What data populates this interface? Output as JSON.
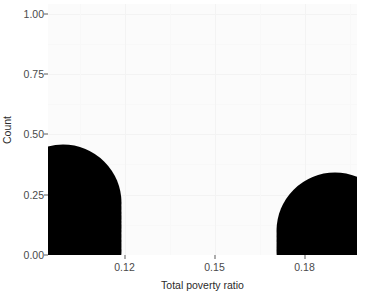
{
  "chart_data": {
    "type": "scatter",
    "plot_style": "dotplot",
    "title": "",
    "xlabel": "Total poverty ratio",
    "ylabel": "Count",
    "xlim": [
      0.0945,
      0.1975
    ],
    "ylim": [
      0.0,
      1.04
    ],
    "grid": true,
    "legend": null,
    "xticks": [
      0.12,
      0.15,
      0.18
    ],
    "xtick_labels": [
      "0.12",
      "0.15",
      "0.18"
    ],
    "yticks": [
      0.0,
      0.25,
      0.5,
      0.75,
      1.0
    ],
    "ytick_labels": [
      "0.00",
      "0.25",
      "0.50",
      "0.75",
      "1.00"
    ],
    "x_minor_ticks": [
      0.105,
      0.135,
      0.165,
      0.195
    ],
    "y_minor_ticks": [
      0.125,
      0.375,
      0.625,
      0.875
    ],
    "dot_color": "#000000",
    "dot_diameter_units": 0.039,
    "stacks": [
      {
        "x": 0.0995,
        "count": 6,
        "values": [
          0.0195,
          0.0585,
          0.0975,
          0.1365,
          0.1755,
          0.2145
        ]
      },
      {
        "x": 0.1903,
        "count": 3,
        "values": [
          0.0195,
          0.0585,
          0.0975
        ]
      }
    ],
    "points": [
      {
        "x": 0.0995,
        "y": 0.0195
      },
      {
        "x": 0.0995,
        "y": 0.0585
      },
      {
        "x": 0.0995,
        "y": 0.0975
      },
      {
        "x": 0.0995,
        "y": 0.1365
      },
      {
        "x": 0.0995,
        "y": 0.1755
      },
      {
        "x": 0.0995,
        "y": 0.2145
      },
      {
        "x": 0.1903,
        "y": 0.0195
      },
      {
        "x": 0.1903,
        "y": 0.0585
      },
      {
        "x": 0.1903,
        "y": 0.0975
      }
    ]
  },
  "colors": {
    "panel_background": "#fbfbfb",
    "figure_background": "#ffffff",
    "grid_major": "#f3f3f3",
    "grid_minor": "#f8f8f8",
    "axis_text": "#4a4a4a",
    "axis_title": "#2b2b2b",
    "tick_mark": "#5a5a5a"
  }
}
